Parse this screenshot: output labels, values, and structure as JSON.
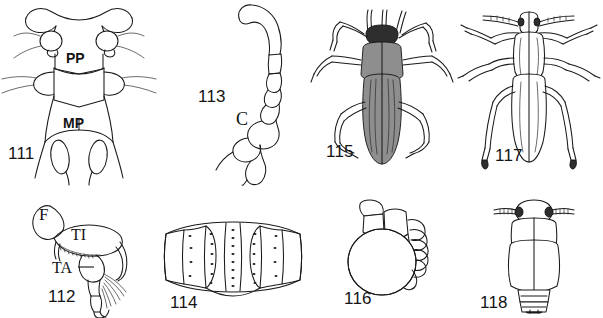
{
  "plate": {
    "title": "Taxonomic figure plate 111-118",
    "background_color": "#ffffff",
    "ink_color": "#1a1a1a",
    "width": 603,
    "height": 318
  },
  "figures": [
    {
      "number": "111",
      "caption_text": "111",
      "description": "ventral view of head showing prementum and mentum",
      "labels": [
        {
          "text": "PP",
          "meaning": "palpiger / prementum plate"
        },
        {
          "text": "MP",
          "meaning": "mentum plate"
        }
      ]
    },
    {
      "number": "113",
      "caption_text": "113",
      "description": "antenna with elongate scape and segmented flagellum",
      "labels": [
        {
          "text": "C",
          "meaning": "club segment"
        }
      ]
    },
    {
      "number": "115",
      "caption_text": "115",
      "description": "dorsal habitus of beetle with coarsely punctate striate elytra",
      "labels": []
    },
    {
      "number": "117",
      "caption_text": "117",
      "description": "dorsal habitus of beetle with long slender legs and finely stippled elytra",
      "labels": []
    },
    {
      "number": "112",
      "caption_text": "112",
      "description": "detail of leg showing femur, tibia and tarsus",
      "labels": [
        {
          "text": "F",
          "meaning": "femur"
        },
        {
          "text": "TI",
          "meaning": "tibia"
        },
        {
          "text": "TA",
          "meaning": "tarsus"
        }
      ]
    },
    {
      "number": "114",
      "caption_text": "114",
      "description": "pronotum with longitudinal carinae and punctate lateral areas",
      "labels": []
    },
    {
      "number": "116",
      "caption_text": "116",
      "description": "oval reticulate elytron with coiled appendage",
      "labels": []
    },
    {
      "number": "118",
      "caption_text": "118",
      "description": "outline dorsal habitus with segmented abdomen",
      "labels": []
    }
  ]
}
